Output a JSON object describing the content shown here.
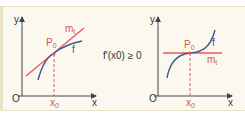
{
  "condition": "f'(x0) ≥ 0",
  "colors": {
    "tangent": "#e8585a",
    "curve": "#3b5a86",
    "axis": "#444444",
    "background": "#fbf9ef"
  },
  "left_graph": {
    "y_label": "y",
    "x_label": "x",
    "origin": "O",
    "point": "P",
    "point_sub": "0",
    "tangent": "m",
    "tangent_sub": "t",
    "curve": "f",
    "x0": "x",
    "x0_sub": "0"
  },
  "right_graph": {
    "y_label": "y",
    "x_label": "x",
    "origin": "O",
    "point": "P",
    "point_sub": "0",
    "tangent": "m",
    "tangent_sub": "t",
    "curve": "f",
    "x0": "x",
    "x0_sub": "0"
  }
}
